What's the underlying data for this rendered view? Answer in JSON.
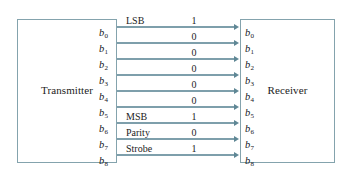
{
  "diagram": {
    "line_color": "#7e9fab",
    "box_border_color": "#84a3ad",
    "text_color": "#1c1c1c",
    "transmitter": {
      "label": "Transmitter",
      "ports": [
        {
          "base": "b",
          "index": "0"
        },
        {
          "base": "b",
          "index": "1"
        },
        {
          "base": "b",
          "index": "2"
        },
        {
          "base": "b",
          "index": "3"
        },
        {
          "base": "b",
          "index": "4"
        },
        {
          "base": "b",
          "index": "5"
        },
        {
          "base": "b",
          "index": "6"
        },
        {
          "base": "b",
          "index": "7"
        },
        {
          "base": "b",
          "index": "8"
        }
      ]
    },
    "receiver": {
      "label": "Receiver",
      "ports": [
        {
          "base": "b",
          "index": "0"
        },
        {
          "base": "b",
          "index": "1"
        },
        {
          "base": "b",
          "index": "2"
        },
        {
          "base": "b",
          "index": "3"
        },
        {
          "base": "b",
          "index": "4"
        },
        {
          "base": "b",
          "index": "5"
        },
        {
          "base": "b",
          "index": "6"
        },
        {
          "base": "b",
          "index": "7"
        },
        {
          "base": "b",
          "index": "8"
        }
      ]
    },
    "signals": [
      {
        "name": "LSB",
        "value": "1"
      },
      {
        "name": "",
        "value": "0"
      },
      {
        "name": "",
        "value": "0"
      },
      {
        "name": "",
        "value": "0"
      },
      {
        "name": "",
        "value": "0"
      },
      {
        "name": "",
        "value": "0"
      },
      {
        "name": "MSB",
        "value": "1"
      },
      {
        "name": "Parity",
        "value": "0"
      },
      {
        "name": "Strobe",
        "value": "1"
      }
    ]
  }
}
